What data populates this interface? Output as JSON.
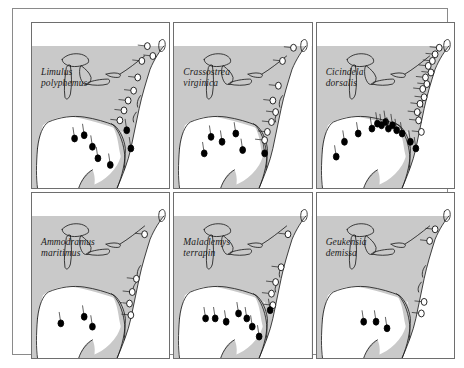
{
  "figure": {
    "title": "",
    "caption": "",
    "panel_count": 6,
    "rows": 2,
    "columns": 3,
    "colors": {
      "land": "#c9c9c9",
      "water": "#ffffff",
      "coastline": "#1a1a1a",
      "filled_marker": "#000000",
      "open_marker": "#ffffff",
      "marker_outline": "#000000",
      "panel_border": "#6e6e6e",
      "outer_frame": "#8a8a8a",
      "background": "#ffffff",
      "label_text": "#1a1a1a"
    }
  },
  "panels": [
    {
      "id": "panel-limulus-polyphemus",
      "genus": "Limulus",
      "epithet": "polyphemus",
      "row": 1,
      "column": 1,
      "filled_count": 7,
      "open_count": 8
    },
    {
      "id": "panel-crassostrea-virginica",
      "genus": "Crassostrea",
      "epithet": "virginica",
      "row": 1,
      "column": 2,
      "filled_count": 6,
      "open_count": 8
    },
    {
      "id": "panel-cicindela-dorsalis",
      "genus": "Cicindela",
      "epithet": "dorsalis",
      "row": 1,
      "column": 3,
      "filled_count": 13,
      "open_count": 13
    },
    {
      "id": "panel-ammodramus-maritimus",
      "genus": "Ammodramus",
      "epithet": "maritimus",
      "row": 2,
      "column": 1,
      "filled_count": 3,
      "open_count": 5
    },
    {
      "id": "panel-malaclemys-terrapin",
      "genus": "Malaclemys",
      "epithet": "terrapin",
      "row": 2,
      "column": 2,
      "filled_count": 8,
      "open_count": 5
    },
    {
      "id": "panel-geukensia-demissa",
      "genus": "Geukensia",
      "epithet": "demissa",
      "row": 2,
      "column": 3,
      "filled_count": 3,
      "open_count": 4
    }
  ],
  "chart_data": {
    "type": "scatter",
    "xlabel": "",
    "ylabel": "",
    "grid": false,
    "legend_position": "none",
    "marker_legend": [
      {
        "symbol": "filled-circle",
        "meaning": "Gulf of Mexico clade sampling locality"
      },
      {
        "symbol": "open-circle",
        "meaning": "Atlantic coast clade sampling locality"
      }
    ],
    "map_extent": "Eastern North America: Great Lakes, Atlantic seaboard, Florida peninsula and Gulf of Mexico coast",
    "series": [
      {
        "name": "Limulus polyphemus",
        "filled_points": [
          {
            "x": 31,
            "y": 70
          },
          {
            "x": 38,
            "y": 68
          },
          {
            "x": 44,
            "y": 75
          },
          {
            "x": 48,
            "y": 82
          },
          {
            "x": 57,
            "y": 86
          },
          {
            "x": 69,
            "y": 65
          },
          {
            "x": 72,
            "y": 76
          }
        ],
        "open_points": [
          {
            "x": 84,
            "y": 14
          },
          {
            "x": 88,
            "y": 20
          },
          {
            "x": 80,
            "y": 23
          },
          {
            "x": 77,
            "y": 33
          },
          {
            "x": 74,
            "y": 41
          },
          {
            "x": 70,
            "y": 47
          },
          {
            "x": 67,
            "y": 53
          },
          {
            "x": 64,
            "y": 59
          }
        ]
      },
      {
        "name": "Crassostrea virginica",
        "filled_points": [
          {
            "x": 27,
            "y": 69
          },
          {
            "x": 35,
            "y": 72
          },
          {
            "x": 45,
            "y": 67
          },
          {
            "x": 22,
            "y": 79
          },
          {
            "x": 50,
            "y": 77
          },
          {
            "x": 66,
            "y": 79
          }
        ],
        "open_points": [
          {
            "x": 87,
            "y": 15
          },
          {
            "x": 79,
            "y": 23
          },
          {
            "x": 76,
            "y": 38
          },
          {
            "x": 72,
            "y": 47
          },
          {
            "x": 74,
            "y": 54
          },
          {
            "x": 71,
            "y": 60
          },
          {
            "x": 68,
            "y": 66
          },
          {
            "x": 66,
            "y": 71
          }
        ]
      },
      {
        "name": "Cicindela dorsalis",
        "filled_points": [
          {
            "x": 20,
            "y": 72
          },
          {
            "x": 14,
            "y": 81
          },
          {
            "x": 30,
            "y": 67
          },
          {
            "x": 40,
            "y": 64
          },
          {
            "x": 44,
            "y": 61
          },
          {
            "x": 47,
            "y": 62
          },
          {
            "x": 50,
            "y": 60
          },
          {
            "x": 52,
            "y": 64
          },
          {
            "x": 55,
            "y": 62
          },
          {
            "x": 58,
            "y": 65
          },
          {
            "x": 62,
            "y": 67
          },
          {
            "x": 68,
            "y": 72
          },
          {
            "x": 72,
            "y": 76
          }
        ],
        "open_points": [
          {
            "x": 89,
            "y": 15
          },
          {
            "x": 86,
            "y": 19
          },
          {
            "x": 84,
            "y": 23
          },
          {
            "x": 81,
            "y": 26
          },
          {
            "x": 83,
            "y": 30
          },
          {
            "x": 79,
            "y": 33
          },
          {
            "x": 80,
            "y": 37
          },
          {
            "x": 77,
            "y": 40
          },
          {
            "x": 78,
            "y": 45
          },
          {
            "x": 75,
            "y": 49
          },
          {
            "x": 73,
            "y": 54
          },
          {
            "x": 74,
            "y": 59
          },
          {
            "x": 76,
            "y": 66
          }
        ]
      },
      {
        "name": "Ammodramus maritimus",
        "filled_points": [
          {
            "x": 21,
            "y": 79
          },
          {
            "x": 38,
            "y": 75
          },
          {
            "x": 44,
            "y": 81
          }
        ],
        "open_points": [
          {
            "x": 82,
            "y": 25
          },
          {
            "x": 76,
            "y": 52
          },
          {
            "x": 73,
            "y": 60
          },
          {
            "x": 71,
            "y": 67
          },
          {
            "x": 72,
            "y": 74
          }
        ]
      },
      {
        "name": "Malaclemys terrapin",
        "filled_points": [
          {
            "x": 23,
            "y": 76
          },
          {
            "x": 30,
            "y": 76
          },
          {
            "x": 38,
            "y": 78
          },
          {
            "x": 47,
            "y": 73
          },
          {
            "x": 53,
            "y": 76
          },
          {
            "x": 57,
            "y": 81
          },
          {
            "x": 62,
            "y": 87
          },
          {
            "x": 70,
            "y": 71
          }
        ],
        "open_points": [
          {
            "x": 83,
            "y": 25
          },
          {
            "x": 78,
            "y": 45
          },
          {
            "x": 74,
            "y": 54
          },
          {
            "x": 71,
            "y": 61
          },
          {
            "x": 72,
            "y": 68
          }
        ]
      },
      {
        "name": "Geukensia demissa",
        "filled_points": [
          {
            "x": 34,
            "y": 78
          },
          {
            "x": 43,
            "y": 78
          },
          {
            "x": 51,
            "y": 82
          }
        ],
        "open_points": [
          {
            "x": 86,
            "y": 22
          },
          {
            "x": 82,
            "y": 29
          },
          {
            "x": 78,
            "y": 66
          },
          {
            "x": 76,
            "y": 73
          }
        ]
      }
    ]
  }
}
